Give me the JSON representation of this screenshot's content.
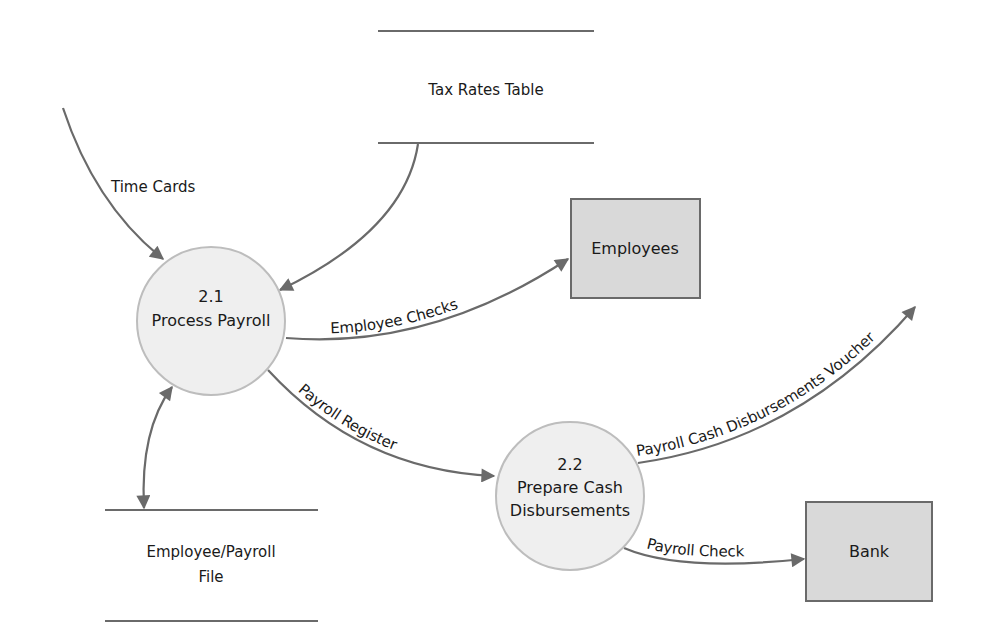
{
  "diagram": {
    "type": "data-flow-diagram",
    "processes": [
      {
        "id": "p21",
        "number": "2.1",
        "name": "Process Payroll"
      },
      {
        "id": "p22",
        "number": "2.2",
        "name_line1": "Prepare Cash",
        "name_line2": "Disbursements"
      }
    ],
    "entities": [
      {
        "id": "employees",
        "label": "Employees"
      },
      {
        "id": "bank",
        "label": "Bank"
      }
    ],
    "data_stores": [
      {
        "id": "tax",
        "label": "Tax Rates Table"
      },
      {
        "id": "empfile",
        "label_line1": "Employee/Payroll",
        "label_line2": "File"
      }
    ],
    "flows": [
      {
        "id": "timecards",
        "label": "Time Cards",
        "from": "external",
        "to": "p21"
      },
      {
        "id": "taxrates",
        "label": "",
        "from": "tax",
        "to": "p21"
      },
      {
        "id": "empchecks",
        "label": "Employee Checks",
        "from": "p21",
        "to": "employees"
      },
      {
        "id": "register",
        "label": "Payroll Register",
        "from": "p21",
        "to": "p22"
      },
      {
        "id": "voucher",
        "label": "Payroll Cash Disbursements Voucher",
        "from": "p22",
        "to": "external"
      },
      {
        "id": "check",
        "label": "Payroll Check",
        "from": "p22",
        "to": "bank"
      },
      {
        "id": "fileio",
        "label": "",
        "from": "empfile",
        "to": "p21",
        "bidirectional": true
      }
    ],
    "colors": {
      "line": "#6a6a6a",
      "process_fill": "#efefef",
      "entity_fill": "#d9d9d9"
    }
  }
}
